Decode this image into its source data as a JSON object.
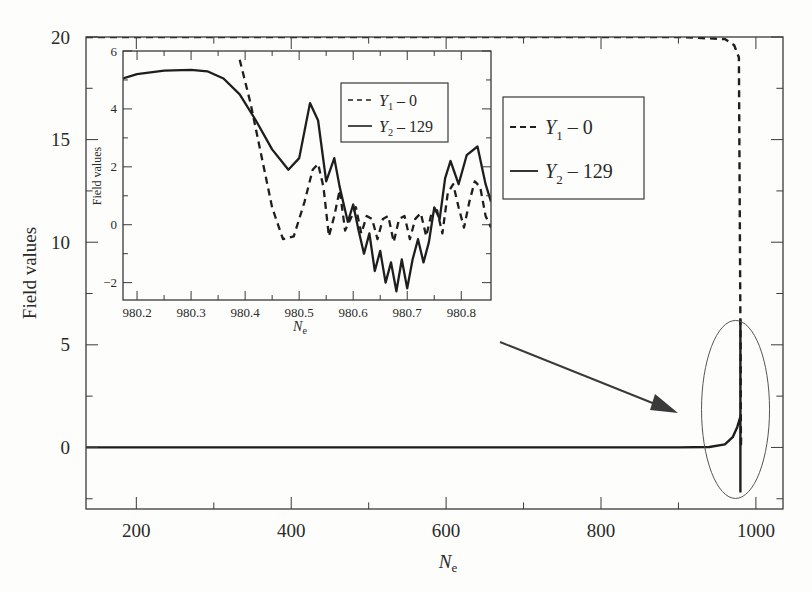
{
  "chart_data": [
    {
      "id": "main",
      "type": "line",
      "title": "",
      "xlabel": "N",
      "xlabel_sub": "e",
      "ylabel": "Field values",
      "xlim": [
        135,
        1035
      ],
      "ylim": [
        -3,
        20
      ],
      "xticks": [
        200,
        400,
        600,
        800,
        1000
      ],
      "xticks_minor": [
        300,
        500,
        700,
        900
      ],
      "yticks": [
        0,
        5,
        10,
        15,
        20
      ],
      "yticks_minor": [
        -2.5,
        2.5,
        7.5,
        12.5,
        17.5
      ],
      "grid": false,
      "legend_position": "upper right (inside)",
      "series": [
        {
          "name": "Y1 - 0",
          "legend_var": "Y",
          "legend_sub": "1",
          "legend_rest": " – 0",
          "style": "dashed",
          "x": [
            135,
            300,
            500,
            700,
            900,
            960,
            972,
            978,
            980,
            980.3,
            980.6,
            980.86
          ],
          "y": [
            20,
            20,
            20,
            20,
            20,
            19.9,
            19.6,
            19.0,
            6,
            5.3,
            0,
            0.5
          ]
        },
        {
          "name": "Y2 - 129",
          "legend_var": "Y",
          "legend_sub": "2",
          "legend_rest": " – 129",
          "style": "solid",
          "x": [
            135,
            300,
            500,
            700,
            900,
            940,
            960,
            970,
            976,
            980,
            980,
            980
          ],
          "y": [
            0,
            0,
            0,
            0,
            0,
            0.02,
            0.15,
            0.5,
            1.0,
            1.5,
            6.2,
            -2.2
          ]
        }
      ],
      "annotations": [
        {
          "type": "ellipse",
          "label": "zoom region",
          "cx": 975,
          "cy": 1.9,
          "note": "circled region around N_e ≈ 975, field values -3 to 6"
        },
        {
          "type": "arrow",
          "from": "inset",
          "to": "circled region"
        }
      ]
    },
    {
      "id": "inset",
      "type": "line",
      "title": "",
      "xlabel": "N",
      "xlabel_sub": "e",
      "ylabel": "Field values",
      "xlim": [
        980.174,
        980.855
      ],
      "ylim": [
        -2.6,
        6
      ],
      "xticks": [
        980.2,
        980.3,
        980.4,
        980.5,
        980.6,
        980.7,
        980.8
      ],
      "xtick_labels": [
        "980.2",
        "980.3",
        "980.4",
        "980.5",
        "980.6",
        "980.7",
        "980.8"
      ],
      "yticks": [
        -2,
        0,
        2,
        4,
        6
      ],
      "yticks_minor": [
        -1,
        1,
        3,
        5
      ],
      "grid": false,
      "legend_position": "upper center-right (inside)",
      "series": [
        {
          "name": "Y1 - 0",
          "legend_var": "Y",
          "legend_sub": "1",
          "legend_rest": " – 0",
          "style": "dashed",
          "x": [
            980.39,
            980.41,
            980.43,
            980.45,
            980.47,
            980.49,
            980.51,
            980.525,
            980.535,
            980.545,
            980.555,
            980.565,
            980.575,
            980.585,
            980.595,
            980.605,
            980.615,
            980.625,
            980.635,
            980.645,
            980.655,
            980.665,
            980.675,
            980.685,
            980.695,
            980.705,
            980.715,
            980.725,
            980.735,
            980.745,
            980.755,
            980.765,
            980.775,
            980.785,
            980.795,
            980.805,
            980.815,
            980.825,
            980.835,
            980.845,
            980.855
          ],
          "y": [
            5.7,
            4.2,
            2.4,
            0.6,
            -0.5,
            -0.4,
            0.8,
            1.9,
            2.1,
            1.3,
            -0.4,
            0.3,
            1.2,
            -0.2,
            0.2,
            0.6,
            -0.3,
            0.3,
            0.2,
            -0.5,
            0.2,
            0.3,
            -0.6,
            0.2,
            0.3,
            -0.5,
            0.2,
            0.4,
            -0.4,
            0.4,
            0.5,
            -0.3,
            1.1,
            1.4,
            0.6,
            -0.1,
            0.8,
            1.5,
            1.3,
            0.3,
            -0.1
          ]
        },
        {
          "name": "Y2 - 129",
          "legend_var": "Y",
          "legend_sub": "2",
          "legend_rest": " – 129",
          "style": "solid",
          "x": [
            980.174,
            980.2,
            980.25,
            980.3,
            980.33,
            980.36,
            980.39,
            980.42,
            980.45,
            980.48,
            980.5,
            980.52,
            980.535,
            980.55,
            980.565,
            980.575,
            980.59,
            980.6,
            980.61,
            980.62,
            980.63,
            980.64,
            980.65,
            980.66,
            980.67,
            980.68,
            980.69,
            980.7,
            980.71,
            980.72,
            980.73,
            980.74,
            980.75,
            980.76,
            980.77,
            980.78,
            980.795,
            980.81,
            980.83,
            980.845,
            980.855
          ],
          "y": [
            5.05,
            5.2,
            5.32,
            5.35,
            5.3,
            5.05,
            4.5,
            3.6,
            2.6,
            1.9,
            2.3,
            4.2,
            3.6,
            1.5,
            2.3,
            1.3,
            0.1,
            0.7,
            -0.2,
            -1.0,
            -0.3,
            -1.6,
            -0.9,
            -2.0,
            -1.3,
            -2.3,
            -1.2,
            -2.2,
            -1.2,
            -0.5,
            -1.3,
            -0.6,
            0.6,
            0.2,
            1.6,
            2.2,
            1.4,
            2.4,
            2.7,
            1.4,
            0.8
          ]
        }
      ]
    }
  ],
  "labels": {
    "main_ylabel": "Field values",
    "main_xlabel": "N",
    "main_xlabel_sub": "e",
    "inset_ylabel": "Field values",
    "inset_xlabel": "N",
    "inset_xlabel_sub": "e"
  },
  "colors": {
    "line": "#1e1e1e",
    "frame": "#3a3a3a",
    "ellipse": "#555555",
    "arrow": "#3a3a3a",
    "background": "#fdfdfb"
  }
}
